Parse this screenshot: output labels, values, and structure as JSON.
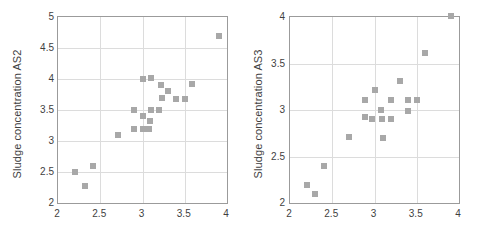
{
  "chart_data": [
    {
      "type": "scatter",
      "title": "",
      "xlabel": "",
      "ylabel": "Sludge concentration AS2",
      "xlim": [
        2,
        4
      ],
      "ylim": [
        2,
        5
      ],
      "xticks": [
        "2",
        "2.5",
        "3",
        "3.5",
        "4"
      ],
      "xtick_values": [
        2,
        2.5,
        3,
        3.5,
        4
      ],
      "yticks": [
        "2",
        "2.5",
        "3",
        "3.5",
        "4",
        "4.5",
        "5"
      ],
      "ytick_values": [
        2,
        2.5,
        3,
        3.5,
        4,
        4.5,
        5
      ],
      "grid": true,
      "legend": null,
      "marker": "square",
      "marker_color": "#a8a8a8",
      "points": [
        [
          2.2,
          2.5
        ],
        [
          2.32,
          2.28
        ],
        [
          2.41,
          2.6
        ],
        [
          2.71,
          3.1
        ],
        [
          2.9,
          3.5
        ],
        [
          2.9,
          3.2
        ],
        [
          3.0,
          4.0
        ],
        [
          3.0,
          3.4
        ],
        [
          3.0,
          3.2
        ],
        [
          3.08,
          3.2
        ],
        [
          3.09,
          3.33
        ],
        [
          3.1,
          4.01
        ],
        [
          3.1,
          3.5
        ],
        [
          3.2,
          3.5
        ],
        [
          3.22,
          3.9
        ],
        [
          3.23,
          3.7
        ],
        [
          3.3,
          3.8
        ],
        [
          3.4,
          3.68
        ],
        [
          3.5,
          3.68
        ],
        [
          3.59,
          3.92
        ],
        [
          3.9,
          4.7
        ]
      ]
    },
    {
      "type": "scatter",
      "title": "",
      "xlabel": "",
      "ylabel": "Sludge concentration AS3",
      "xlim": [
        2,
        4
      ],
      "ylim": [
        2,
        4
      ],
      "xticks": [
        "2",
        "2.5",
        "3",
        "3.5",
        "4"
      ],
      "xtick_values": [
        2,
        2.5,
        3,
        3.5,
        4
      ],
      "yticks": [
        "2",
        "2.5",
        "3",
        "3.5",
        "4"
      ],
      "ytick_values": [
        2,
        2.5,
        3,
        3.5,
        4
      ],
      "grid": true,
      "legend": null,
      "marker": "square",
      "marker_color": "#a8a8a8",
      "points": [
        [
          2.2,
          2.19
        ],
        [
          2.3,
          2.1
        ],
        [
          2.4,
          2.4
        ],
        [
          2.7,
          2.71
        ],
        [
          2.89,
          3.11
        ],
        [
          2.89,
          2.92
        ],
        [
          2.97,
          2.9
        ],
        [
          3.0,
          3.21
        ],
        [
          3.08,
          3.0
        ],
        [
          3.09,
          2.9
        ],
        [
          3.1,
          2.7
        ],
        [
          3.19,
          3.11
        ],
        [
          3.2,
          2.9
        ],
        [
          3.3,
          3.31
        ],
        [
          3.4,
          3.11
        ],
        [
          3.4,
          2.99
        ],
        [
          3.5,
          3.11
        ],
        [
          3.6,
          3.61
        ],
        [
          3.9,
          4.01
        ]
      ]
    }
  ]
}
